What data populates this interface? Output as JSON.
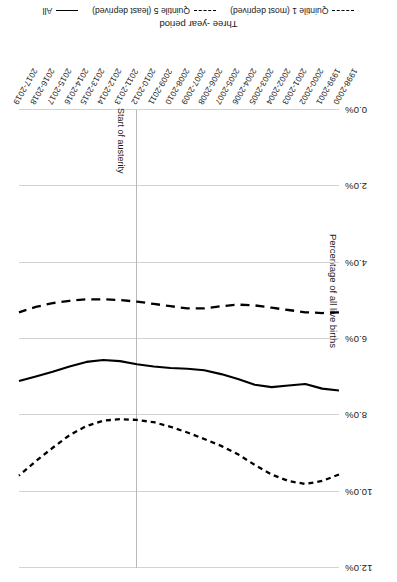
{
  "chart_data": {
    "type": "line",
    "title": "",
    "xlabel": "Three -year period",
    "ylabel": "Percentage of all live births",
    "ylim": [
      0.0,
      12.0
    ],
    "ytick_labels": [
      "0.0%",
      "2.0%",
      "4.0%",
      "6.0%",
      "8.0%",
      "10.0%",
      "12.0%"
    ],
    "ytick_values": [
      0.0,
      2.0,
      4.0,
      6.0,
      8.0,
      10.0,
      12.0
    ],
    "grid": true,
    "legend_position": "bottom",
    "categories": [
      "1998-2000",
      "1999-2001",
      "2000-2002",
      "2001-2003",
      "2002-2004",
      "2003-2005",
      "2004-2006",
      "2005-2007",
      "2006-2008",
      "2007-2009",
      "2008-2010",
      "2009-2011",
      "2010-2012",
      "2011-2013",
      "2012-2014",
      "2013-2015",
      "2014-2016",
      "2015-2017",
      "2016-2018",
      "2017-2019"
    ],
    "series": [
      {
        "name": "Quintile 1 (most deprived)",
        "style": "dash-dot",
        "color": "#000000",
        "values": [
          9.55,
          9.72,
          9.8,
          9.72,
          9.55,
          9.3,
          9.02,
          8.8,
          8.62,
          8.45,
          8.3,
          8.18,
          8.12,
          8.1,
          8.14,
          8.28,
          8.52,
          8.85,
          9.2,
          9.58
        ]
      },
      {
        "name": "Quintile 5 (least deprived)",
        "style": "dashed",
        "color": "#000000",
        "values": [
          5.3,
          5.32,
          5.3,
          5.24,
          5.18,
          5.12,
          5.1,
          5.14,
          5.2,
          5.2,
          5.14,
          5.08,
          5.02,
          4.98,
          4.96,
          4.96,
          5.0,
          5.06,
          5.16,
          5.3
        ]
      },
      {
        "name": "All",
        "style": "solid",
        "color": "#000000",
        "values": [
          7.35,
          7.3,
          7.18,
          7.22,
          7.26,
          7.2,
          7.05,
          6.92,
          6.82,
          6.78,
          6.76,
          6.72,
          6.66,
          6.58,
          6.55,
          6.6,
          6.72,
          6.86,
          6.98,
          7.1
        ]
      }
    ],
    "annotations": [
      {
        "label": "Start of austerity",
        "x_category": "2010-2012",
        "type": "vertical-line"
      }
    ]
  },
  "chart": {
    "axis": {
      "y_title": "Percentage of all live births",
      "x_title": "Three -year period"
    },
    "annotation": {
      "austerity_label": "Start of austerity"
    },
    "legend": {
      "items": [
        {
          "label": "Quintile 1 (most deprived)",
          "style": "dashdot"
        },
        {
          "label": "Quintile 5 (least deprived)",
          "style": "dashed"
        },
        {
          "label": "All",
          "style": "solid"
        }
      ]
    }
  }
}
